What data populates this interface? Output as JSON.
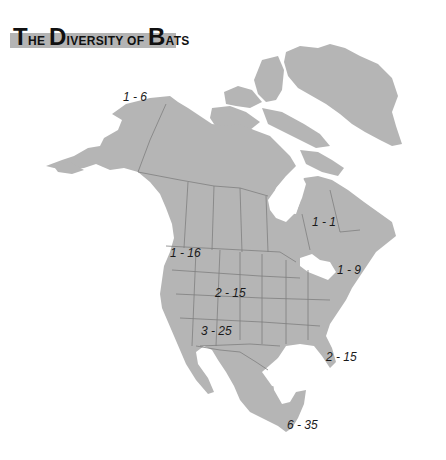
{
  "title": {
    "parts": [
      {
        "text": "T",
        "size": "big"
      },
      {
        "text": "HE ",
        "size": "small"
      },
      {
        "text": "D",
        "size": "big"
      },
      {
        "text": "IVERSITY OF ",
        "size": "small"
      },
      {
        "text": "B",
        "size": "big"
      },
      {
        "text": "ATS",
        "size": "small"
      }
    ],
    "full": "The Diversity of Bats"
  },
  "colors": {
    "land": "#b5b5b5",
    "borders": "#7f7f7f",
    "banner": "#b4b4b4",
    "background": "#ffffff",
    "text": "#1a1a1a"
  },
  "regions": [
    {
      "name": "alaska",
      "label": "1 - 6",
      "x": 123,
      "y": 90
    },
    {
      "name": "hudson-bay-quebec",
      "label": "1 - 1",
      "x": 312,
      "y": 215
    },
    {
      "name": "northeast-us",
      "label": "1 - 9",
      "x": 337,
      "y": 263
    },
    {
      "name": "pacific-northwest",
      "label": "1 - 16",
      "x": 170,
      "y": 246
    },
    {
      "name": "central-plains-rockies",
      "label": "2 - 15",
      "x": 215,
      "y": 286
    },
    {
      "name": "southwest",
      "label": "3 - 25",
      "x": 201,
      "y": 324
    },
    {
      "name": "florida-southeast",
      "label": "2 - 15",
      "x": 326,
      "y": 350
    },
    {
      "name": "southern-mexico-yucatan",
      "label": "6 - 35",
      "x": 287,
      "y": 418
    }
  ]
}
